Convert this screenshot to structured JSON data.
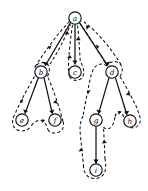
{
  "figure": {
    "type": "tree-traversal-diagram",
    "background_color": "#ffffff",
    "ink_color": "#111111"
  },
  "graph": {
    "node_radius": 6.2,
    "nodes": [
      {
        "id": "a",
        "label": "a",
        "x": 75,
        "y": 18,
        "depth": 0
      },
      {
        "id": "b",
        "label": "b",
        "x": 41,
        "y": 72,
        "depth": 1
      },
      {
        "id": "c",
        "label": "c",
        "x": 75,
        "y": 72,
        "depth": 1
      },
      {
        "id": "d",
        "label": "d",
        "x": 112,
        "y": 72,
        "depth": 1
      },
      {
        "id": "e",
        "label": "e",
        "x": 22,
        "y": 120,
        "depth": 2
      },
      {
        "id": "f",
        "label": "f",
        "x": 55,
        "y": 120,
        "depth": 2
      },
      {
        "id": "g",
        "label": "g",
        "x": 96,
        "y": 120,
        "depth": 2
      },
      {
        "id": "h",
        "label": "h",
        "x": 130,
        "y": 121,
        "depth": 2
      },
      {
        "id": "i",
        "label": "i",
        "x": 96,
        "y": 170,
        "depth": 3
      }
    ],
    "tree_edges": [
      {
        "from": "a",
        "to": "b",
        "directed": true
      },
      {
        "from": "a",
        "to": "c",
        "directed": true
      },
      {
        "from": "a",
        "to": "d",
        "directed": true
      },
      {
        "from": "b",
        "to": "e",
        "directed": true
      },
      {
        "from": "b",
        "to": "f",
        "directed": true
      },
      {
        "from": "d",
        "to": "g",
        "directed": true
      },
      {
        "from": "d",
        "to": "h",
        "directed": true
      },
      {
        "from": "g",
        "to": "i",
        "directed": true
      }
    ],
    "tour_order": [
      "a",
      "b",
      "e",
      "b",
      "f",
      "b",
      "a",
      "c",
      "a",
      "d",
      "g",
      "i",
      "g",
      "d",
      "h",
      "d",
      "a"
    ],
    "tour_style": "dashed",
    "tour_direction": "counterclockwise"
  }
}
